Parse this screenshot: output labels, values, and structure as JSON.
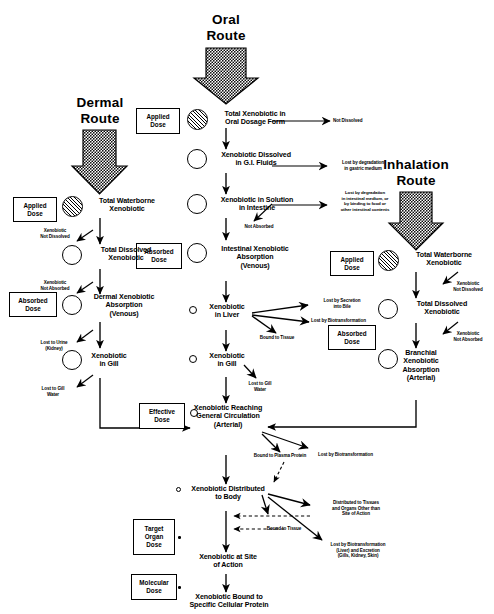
{
  "diagram": {
    "routes": [
      {
        "id": "oral",
        "label": "Oral\nRoute"
      },
      {
        "id": "dermal",
        "label": "Dermal\nRoute"
      },
      {
        "id": "inhalation",
        "label": "Inhalation\nRoute"
      }
    ],
    "dose_boxes": [
      {
        "id": "oral-applied",
        "label": "Applied\nDose"
      },
      {
        "id": "oral-absorbed",
        "label": "Absorbed\nDose"
      },
      {
        "id": "dermal-applied",
        "label": "Applied\nDose"
      },
      {
        "id": "dermal-absorbed",
        "label": "Absorbed\nDose"
      },
      {
        "id": "inhal-applied",
        "label": "Applied\nDose"
      },
      {
        "id": "inhal-absorbed",
        "label": "Absorbed\nDose"
      },
      {
        "id": "effective",
        "label": "Effective\nDose"
      },
      {
        "id": "target-organ",
        "label": "Target\nOrgan\nDose"
      },
      {
        "id": "molecular",
        "label": "Molecular\nDose"
      }
    ],
    "nodes": [
      {
        "id": "oral-1",
        "label": "Total Xenobiotic in\nOral Dosage Form"
      },
      {
        "id": "oral-2",
        "label": "Xenobiotic Dissolved\nin G.I. Fluids"
      },
      {
        "id": "oral-3",
        "label": "Xenobiotic in Solution\nin Intestine"
      },
      {
        "id": "oral-4",
        "label": "Intestinal Xenobiotic\nAbsorption\n(Venous)"
      },
      {
        "id": "liver",
        "label": "Xenobiotic\nin Liver"
      },
      {
        "id": "gill-center",
        "label": "Xenobiotic\nin Gill"
      },
      {
        "id": "derm-1",
        "label": "Total Waterborne\nXenobiotic"
      },
      {
        "id": "derm-2",
        "label": "Total Dissolved\nXenobiotic"
      },
      {
        "id": "derm-3",
        "label": "Dermal Xenobiotic\nAbsorption\n(Venous)"
      },
      {
        "id": "derm-4",
        "label": "Xenobiotic\nin Gill"
      },
      {
        "id": "inh-1",
        "label": "Total Waterborne\nXenobiotic"
      },
      {
        "id": "inh-2",
        "label": "Total Dissolved\nXenobiotic"
      },
      {
        "id": "inh-3",
        "label": "Branchial\nXenobiotic\nAbsorption\n(Arterial)"
      },
      {
        "id": "circulation",
        "label": "Xenobiotic Reaching\nGeneral Circulation\n(Arterial)"
      },
      {
        "id": "distributed",
        "label": "Xenobiotic Distributed\nto Body"
      },
      {
        "id": "site-action",
        "label": "Xenobiotic at Site\nof Action"
      },
      {
        "id": "bound-protein",
        "label": "Xenobiotic Bound to\nSpecific Cellular Protein"
      }
    ],
    "annotations": [
      {
        "id": "not-dissolved-oral",
        "label": "Not Dissolved"
      },
      {
        "id": "lost-gastric",
        "label": "Lost by degradation\nin gastric medium"
      },
      {
        "id": "lost-intestinal",
        "label": "Lost by degradation\nin intestinal medium, or\nby binding to food or\nother intestinal contents"
      },
      {
        "id": "not-absorbed-oral",
        "label": "Not Absorbed"
      },
      {
        "id": "lost-bile",
        "label": "Lost by Secretion\ninto Bile"
      },
      {
        "id": "lost-biotrans-liver",
        "label": "Lost by Biotransformation"
      },
      {
        "id": "bound-tissue-liver",
        "label": "Bound to Tissue"
      },
      {
        "id": "lost-gill-water-center",
        "label": "Lost to Gill\nWater"
      },
      {
        "id": "derm-not-dissolved",
        "label": "Xenobiotic\nNot Dissolved"
      },
      {
        "id": "derm-not-absorbed",
        "label": "Xenobiotic\nNot Absorbed"
      },
      {
        "id": "lost-urine",
        "label": "Lost to Urine\n(Kidney)"
      },
      {
        "id": "lost-gill-water-left",
        "label": "Lost to Gill\nWater"
      },
      {
        "id": "inh-not-dissolved",
        "label": "Xenobiotic\nNot Dissolved"
      },
      {
        "id": "inh-not-absorbed",
        "label": "Xenobiotic\nNot Absorbed"
      },
      {
        "id": "bound-plasma",
        "label": "Bound to Plasma Protein"
      },
      {
        "id": "lost-biotrans-circ",
        "label": "Lost by Biotransformation"
      },
      {
        "id": "distributed-tissues",
        "label": "Distributed to Tissues\nand Organs Other than\nSite of Action"
      },
      {
        "id": "bound-tissue-body",
        "label": "Bound to Tissue"
      },
      {
        "id": "lost-biotrans-excretion",
        "label": "Lost by Biotransformation\n(Liver) and Excretion\n(Gills, Kidney, Skin)"
      }
    ]
  },
  "colors": {
    "ink": "#000000",
    "paper": "#ffffff"
  }
}
